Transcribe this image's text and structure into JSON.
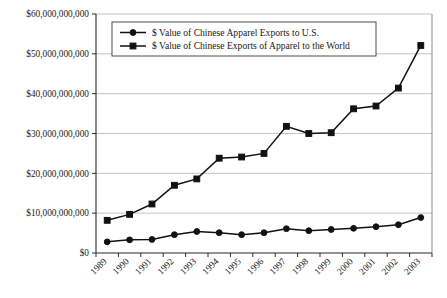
{
  "chart_data": {
    "type": "line",
    "title": "",
    "subtitle": "",
    "xlabel": "",
    "ylabel": "",
    "categories": [
      "1989",
      "1990",
      "1991",
      "1992",
      "1993",
      "1994",
      "1995",
      "1996",
      "1997",
      "1998",
      "1999",
      "2000",
      "2001",
      "2002",
      "2003"
    ],
    "x": [
      1989,
      1990,
      1991,
      1992,
      1993,
      1994,
      1995,
      1996,
      1997,
      1998,
      1999,
      2000,
      2001,
      2002,
      2003
    ],
    "series": [
      {
        "name": "$ Value of Chinese Apparel Exports to U.S.",
        "marker": "circle",
        "values": [
          2800000000,
          3300000000,
          3400000000,
          4600000000,
          5400000000,
          5100000000,
          4600000000,
          5100000000,
          6100000000,
          5600000000,
          5900000000,
          6200000000,
          6600000000,
          7100000000,
          8900000000
        ]
      },
      {
        "name": "$ Value of Chinese Exports of Apparel to the World",
        "marker": "square",
        "values": [
          8200000000,
          9700000000,
          12300000000,
          17000000000,
          18600000000,
          23800000000,
          24100000000,
          25000000000,
          31800000000,
          30000000000,
          30200000000,
          36200000000,
          36900000000,
          41400000000,
          52100000000
        ]
      }
    ],
    "ylim": [
      0,
      60000000000
    ],
    "ytick_values": [
      0,
      10000000000,
      20000000000,
      30000000000,
      40000000000,
      50000000000,
      60000000000
    ],
    "ytick_labels": [
      "$0",
      "$10,000,000,000",
      "$20,000,000,000",
      "$30,000,000,000",
      "$40,000,000,000",
      "$50,000,000,000",
      "$60,000,000,000"
    ],
    "grid": true,
    "grid_axis": "y",
    "legend_position": "top-center",
    "legend_entries": [
      "$ Value of Chinese Apparel Exports to U.S.",
      "$ Value of Chinese Exports of Apparel to the World"
    ],
    "colors": {
      "series_line": "#111111",
      "gridline": "#b4b4b4",
      "axis": "#2b2b2b",
      "background": "#ffffff"
    },
    "x_tick_label_rotation": 45
  }
}
